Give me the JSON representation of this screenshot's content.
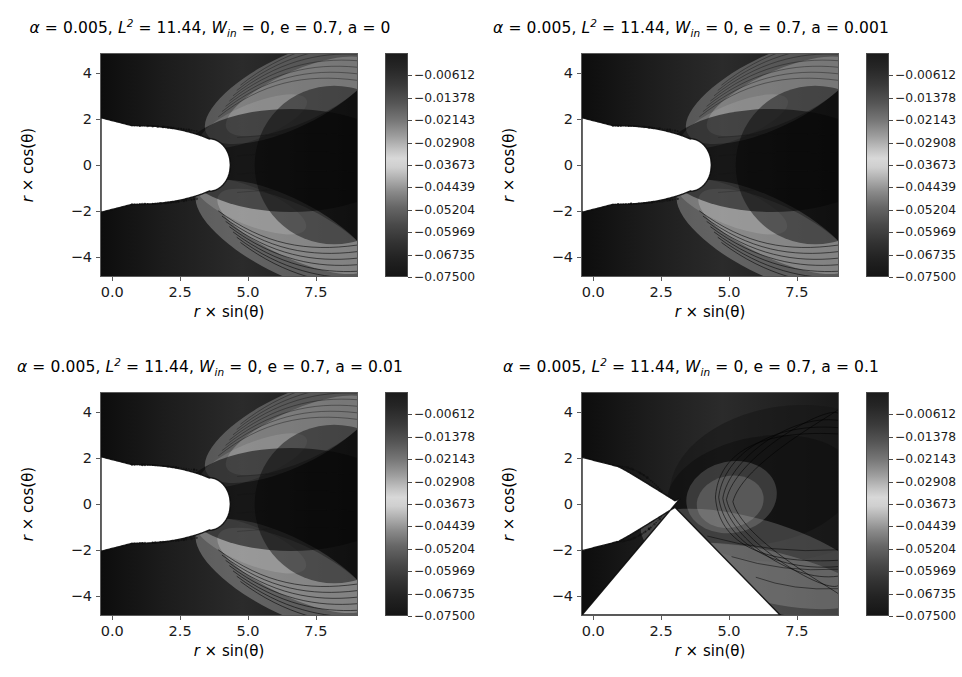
{
  "figure": {
    "type": "contour-grid",
    "rows": 2,
    "cols": 2,
    "background": "#ffffff",
    "colormap": "grayscale"
  },
  "axis": {
    "xlabel_prefix": "r",
    "xlabel_times": "×",
    "xlabel_func": "sin(θ)",
    "ylabel_prefix": "r",
    "ylabel_times": "×",
    "ylabel_func": "cos(θ)",
    "xticks": [
      "0.0",
      "2.5",
      "5.0",
      "7.5"
    ],
    "yticks": [
      "4",
      "2",
      "0",
      "−2",
      "−4"
    ],
    "xlim": [
      -0.45,
      9.05
    ],
    "ylim": [
      -4.85,
      4.85
    ]
  },
  "colorbar": {
    "ticks": [
      "−0.00612",
      "−0.01378",
      "−0.02143",
      "−0.02908",
      "−0.03673",
      "−0.04439",
      "−0.05204",
      "−0.05969",
      "−0.06735",
      "−0.07500"
    ],
    "values": [
      -0.00612,
      -0.01378,
      -0.02143,
      -0.02908,
      -0.03673,
      -0.04439,
      -0.05204,
      -0.05969,
      -0.06735,
      -0.075
    ],
    "vmin": -0.075,
    "vmax": -0.00612
  },
  "panels": [
    {
      "title": {
        "alpha_sym": "α",
        "alpha_val": "0.005",
        "L_sym": "L",
        "L_sup": "2",
        "L_val": "11.44",
        "W_sym": "W",
        "W_sub": "in",
        "W_val": "0",
        "e_sym": "e",
        "e_val": "0.7",
        "a_sym": "a",
        "a_val": "0"
      },
      "a": 0,
      "contour_labels": [
        "-0.052",
        "-0.044",
        "-0.037",
        "-0.029",
        "-0.031"
      ]
    },
    {
      "title": {
        "alpha_sym": "α",
        "alpha_val": "0.005",
        "L_sym": "L",
        "L_sup": "2",
        "L_val": "11.44",
        "W_sym": "W",
        "W_sub": "in",
        "W_val": "0",
        "e_sym": "e",
        "e_val": "0.7",
        "a_sym": "a",
        "a_val": "0.001"
      },
      "a": 0.001,
      "contour_labels": [
        "-0.052",
        "-0.044",
        "-0.037",
        "-0.029",
        "-0.031"
      ]
    },
    {
      "title": {
        "alpha_sym": "α",
        "alpha_val": "0.005",
        "L_sym": "L",
        "L_sup": "2",
        "L_val": "11.44",
        "W_sym": "W",
        "W_sub": "in",
        "W_val": "0",
        "e_sym": "e",
        "e_val": "0.7",
        "a_sym": "a",
        "a_val": "0.01"
      },
      "a": 0.01,
      "contour_labels": [
        "-0.052",
        "-0.044",
        "-0.037",
        "-0.029",
        "-0.031"
      ]
    },
    {
      "title": {
        "alpha_sym": "α",
        "alpha_val": "0.005",
        "L_sym": "L",
        "L_sup": "2",
        "L_val": "11.44",
        "W_sym": "W",
        "W_sub": "in",
        "W_val": "0",
        "e_sym": "e",
        "e_val": "0.7",
        "a_sym": "a",
        "a_val": "0.1"
      },
      "a": 0.1,
      "contour_labels": [
        "-0.052",
        "-0.044",
        "-0.037",
        "-0.017"
      ]
    }
  ],
  "chart_data": {
    "type": "heatmap",
    "xlabel": "r × sin(θ)",
    "ylabel": "r × cos(θ)",
    "xlim": [
      -0.45,
      9.05
    ],
    "ylim": [
      -4.85,
      4.85
    ],
    "xticks": [
      0.0,
      2.5,
      5.0,
      7.5
    ],
    "yticks": [
      -4,
      -2,
      0,
      2,
      4
    ],
    "grid": false,
    "legend": "colorbar-right",
    "colorbar": {
      "vmin": -0.075,
      "vmax": -0.00612,
      "ticks": [
        -0.00612,
        -0.01378,
        -0.02143,
        -0.02908,
        -0.03673,
        -0.04439,
        -0.05204,
        -0.05969,
        -0.06735,
        -0.075
      ],
      "cmap": "grayscale"
    },
    "shared_parameters": {
      "alpha": 0.005,
      "L_squared": 11.44,
      "W_in": 0,
      "e": 0.7
    },
    "panels": [
      {
        "index": 0,
        "position": "top-left",
        "a": 0,
        "contour_levels": [
          -0.052,
          -0.044,
          -0.037,
          -0.031,
          -0.029
        ]
      },
      {
        "index": 1,
        "position": "top-right",
        "a": 0.001,
        "contour_levels": [
          -0.052,
          -0.044,
          -0.037,
          -0.031,
          -0.029
        ]
      },
      {
        "index": 2,
        "position": "bottom-left",
        "a": 0.01,
        "contour_levels": [
          -0.052,
          -0.044,
          -0.037,
          -0.031,
          -0.029
        ]
      },
      {
        "index": 3,
        "position": "bottom-right",
        "a": 0.1,
        "contour_levels": [
          -0.052,
          -0.044,
          -0.037,
          -0.017
        ]
      }
    ]
  }
}
